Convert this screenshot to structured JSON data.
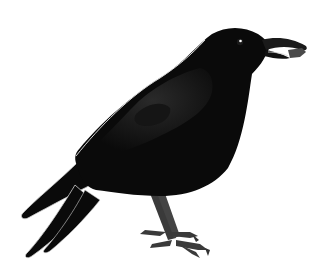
{
  "image": {
    "subject": "crow",
    "description": "Illustration of a black crow standing in profile facing right, holding a small nut in its beak",
    "background": "#ffffff",
    "colors": {
      "body": "#0a0a0a",
      "wing_highlight": "#1e1e1e",
      "legs": "#3a3a3a",
      "nut": "#4a4a4a",
      "edge_highlight": "#d8d8d8",
      "eye_glint": "#ffffff"
    }
  }
}
